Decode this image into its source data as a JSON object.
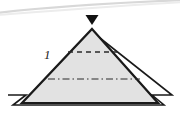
{
  "figure": {
    "kind": "geometric-diagram",
    "canvas": {
      "width": 180,
      "height": 117,
      "background": "#ffffff"
    },
    "labels": [
      {
        "id": "edge-1",
        "text": "1",
        "x": 44,
        "y": 48,
        "style": "italic"
      }
    ],
    "marker": {
      "name": "apex-marker",
      "shape": "filled-down-triangle",
      "color": "#111111",
      "x": 92,
      "y": 15,
      "width": 13,
      "height": 10
    },
    "shapes": {
      "pyramid_front_face": {
        "name": "pyramid-body",
        "points": "92,29 158,103 22,103",
        "fill": "#e2e2e2",
        "stroke": "#1a1a1a",
        "stroke_width": 2.2
      },
      "pyramid_outline_offset": {
        "name": "pyramid-back-outline",
        "points": "91,31 172,95 152,95 164,105 13,105 26,95 8,95",
        "fill": "none",
        "stroke": "#1a1a1a",
        "stroke_width": 1.6
      }
    },
    "internal_lines": [
      {
        "name": "upper-dashed-edge",
        "style": "dashed",
        "x1": 68,
        "y1": 52,
        "x2": 118,
        "y2": 52,
        "stroke": "#2a2a2a",
        "stroke_width": 1.3,
        "dash": "5 4"
      },
      {
        "name": "mid-dash-dot-edge",
        "style": "dash-dot",
        "x1": 48,
        "y1": 79,
        "x2": 140,
        "y2": 79,
        "stroke": "#2a2a2a",
        "stroke_width": 1.2,
        "dash": "7 3 1.5 3"
      }
    ],
    "artifacts": [
      {
        "name": "scan-curve-artifact",
        "path": "M -4 13 C 46 7 112 3 184 0",
        "stroke": "#d8d8d8",
        "stroke_width": 2.2
      },
      {
        "name": "scan-curve-artifact-secondary",
        "path": "M -4 15 C 50 11 116 6 184 2",
        "stroke": "#ececec",
        "stroke_width": 2.0
      }
    ]
  }
}
